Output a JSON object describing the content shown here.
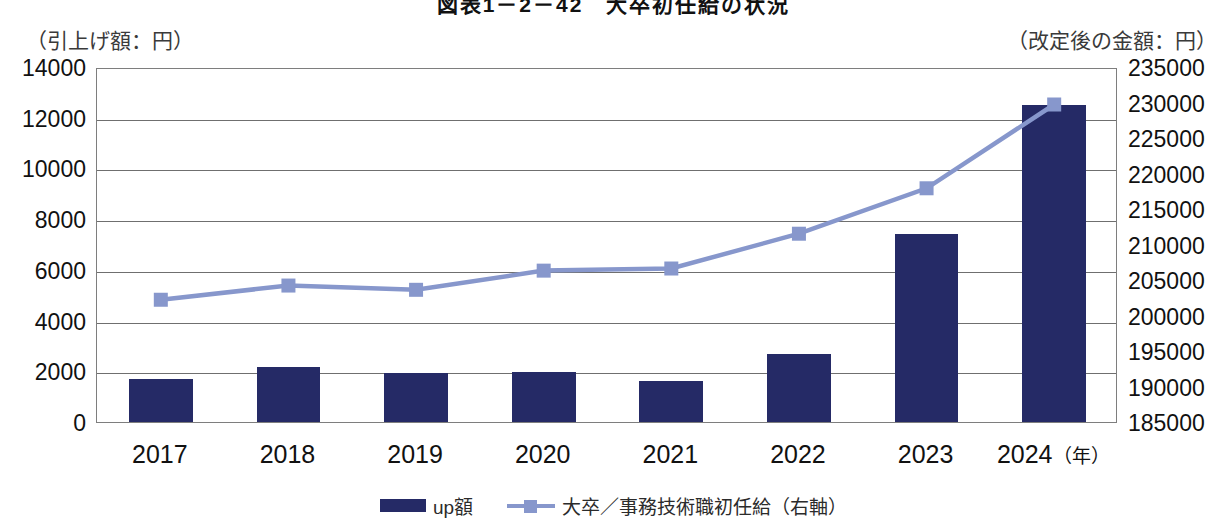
{
  "title": "図表1－2－42　大卒初任給の状況",
  "axis_caption_left": "（引上げ額：円）",
  "axis_caption_right": "（改定後の金額：円）",
  "x_axis_unit_suffix": "（年）",
  "legend": {
    "bar_label": "up額",
    "line_label": "大卒／事務技術職初任給（右軸）"
  },
  "colors": {
    "bar": "#252a66",
    "line": "#8797cc",
    "grid": "#6f6f6f",
    "plot_border": "#7e7e7e",
    "text": "#111111"
  },
  "chart_data": {
    "type": "bar",
    "title": "図表1－2－42　大卒初任給の状況",
    "categories": [
      "2017",
      "2018",
      "2019",
      "2020",
      "2021",
      "2022",
      "2023",
      "2024"
    ],
    "xlabel": "（年）",
    "grid": true,
    "legend_position": "bottom",
    "series": [
      {
        "name": "up額",
        "type": "bar",
        "axis": "left",
        "unit": "円",
        "values": [
          1700,
          2170,
          1950,
          1980,
          1600,
          2700,
          7400,
          12500
        ]
      },
      {
        "name": "大卒／事務技術職初任給（右軸）",
        "type": "line",
        "axis": "right",
        "unit": "円",
        "values": [
          202500,
          204500,
          203900,
          206600,
          206900,
          211800,
          218200,
          230000
        ]
      }
    ],
    "left_axis": {
      "label": "（引上げ額：円）",
      "ylim": [
        0,
        14000
      ],
      "tick_step": 2000,
      "ticks": [
        0,
        2000,
        4000,
        6000,
        8000,
        10000,
        12000,
        14000
      ],
      "tick_labels": [
        "0",
        "2000",
        "4000",
        "6000",
        "8000",
        "10000",
        "12000",
        "14000"
      ]
    },
    "right_axis": {
      "label": "（改定後の金額：円）",
      "ylim": [
        185000,
        235000
      ],
      "tick_step": 5000,
      "ticks": [
        185000,
        190000,
        195000,
        200000,
        205000,
        210000,
        215000,
        220000,
        225000,
        230000,
        235000
      ],
      "tick_labels": [
        "185000",
        "190000",
        "195000",
        "200000",
        "205000",
        "210000",
        "215000",
        "220000",
        "225000",
        "230000",
        "235000"
      ]
    }
  }
}
